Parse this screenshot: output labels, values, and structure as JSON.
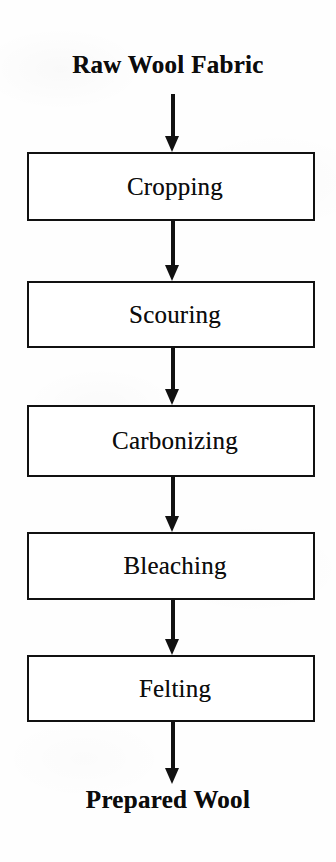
{
  "diagram": {
    "orientation": "vertical-top-to-bottom",
    "colors": {
      "background": "#fefefe",
      "box_fill": "#ffffff",
      "box_border": "#111111",
      "arrow": "#111111",
      "text": "#0d0d0d"
    },
    "start": {
      "label": "Raw Wool Fabric",
      "style": "bold-serif-terminal"
    },
    "end": {
      "label": "Prepared Wool",
      "style": "bold-serif-terminal"
    },
    "steps": [
      {
        "index": 1,
        "label": "Cropping"
      },
      {
        "index": 2,
        "label": "Scouring"
      },
      {
        "index": 3,
        "label": "Carbonizing"
      },
      {
        "index": 4,
        "label": "Bleaching"
      },
      {
        "index": 5,
        "label": "Felting"
      }
    ],
    "connectors": [
      {
        "index": 0,
        "from": "Raw Wool Fabric",
        "to": "Cropping",
        "glyph": "down-arrow"
      },
      {
        "index": 1,
        "from": "Cropping",
        "to": "Scouring",
        "glyph": "down-arrow"
      },
      {
        "index": 2,
        "from": "Scouring",
        "to": "Carbonizing",
        "glyph": "down-arrow"
      },
      {
        "index": 3,
        "from": "Carbonizing",
        "to": "Bleaching",
        "glyph": "down-arrow"
      },
      {
        "index": 4,
        "from": "Bleaching",
        "to": "Felting",
        "glyph": "down-arrow"
      },
      {
        "index": 5,
        "from": "Felting",
        "to": "Prepared Wool",
        "glyph": "down-arrow"
      }
    ]
  }
}
